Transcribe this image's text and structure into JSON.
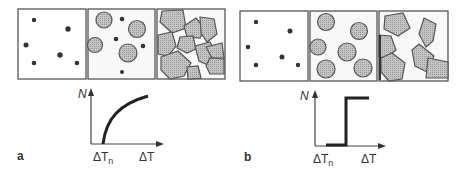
{
  "panels": [
    {
      "id": "a",
      "label": "a",
      "stages": [
        "sparse-nuclei",
        "growing-circular-grains",
        "impinging-polygonal-grains"
      ],
      "graph": {
        "y_label": "N",
        "x_label": "ΔT",
        "x_marker": "ΔT",
        "x_marker_sub": "n",
        "curve": "gradual-rise"
      }
    },
    {
      "id": "b",
      "label": "b",
      "stages": [
        "sparse-nuclei",
        "equal-circular-grains",
        "polygonal-grains"
      ],
      "graph": {
        "y_label": "N",
        "x_label": "ΔT",
        "x_marker": "ΔT",
        "x_marker_sub": "n",
        "curve": "step"
      }
    }
  ],
  "colors": {
    "stroke": "#444444",
    "grain_fill": "#bdbdbd",
    "box_fill": "#f7f7f7",
    "curve": "#222222"
  }
}
